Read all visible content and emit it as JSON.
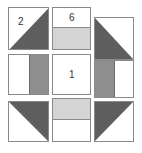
{
  "diagram": {
    "type": "quilt-block-grid",
    "grid": "3x3",
    "colors": {
      "dark": "#5e5e5e",
      "medium": "#8f8f8f",
      "light": "#d4d4d4",
      "white": "#ffffff",
      "border": "#8a8a8a"
    },
    "blocks": [
      {
        "position": "top-left",
        "shape": "half-square-triangle",
        "dark_corner": "bottom-right",
        "label": "2"
      },
      {
        "position": "top-middle",
        "shape": "two-rectangles-horizontal",
        "top": "white",
        "bottom": "light",
        "label": "6"
      },
      {
        "position": "top-right",
        "shape": "half-square-triangle",
        "dark_corner": "bottom-left",
        "label": ""
      },
      {
        "position": "middle-left",
        "shape": "two-rectangles-vertical",
        "left": "white",
        "right": "medium",
        "label": ""
      },
      {
        "position": "center",
        "shape": "square",
        "fill": "white",
        "label": "1"
      },
      {
        "position": "middle-right",
        "shape": "two-rectangles-vertical",
        "left": "medium",
        "right": "white",
        "label": ""
      },
      {
        "position": "bottom-left",
        "shape": "half-square-triangle",
        "dark_corner": "top-right",
        "label": ""
      },
      {
        "position": "bottom-middle",
        "shape": "two-rectangles-horizontal",
        "top": "light",
        "bottom": "white",
        "label": ""
      },
      {
        "position": "bottom-right",
        "shape": "half-square-triangle",
        "dark_corner": "top-left",
        "label": ""
      }
    ]
  }
}
